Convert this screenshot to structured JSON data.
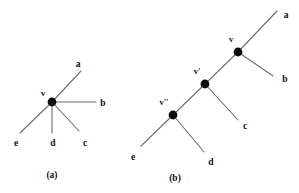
{
  "figure": {
    "background_color": "#ffffff",
    "edge_color": "#6e6e6e",
    "node_color": "#0b0b0b",
    "text_color": "#111111",
    "panels": [
      {
        "id": "panel-a",
        "caption": "(a)",
        "node_labels": [
          "v"
        ],
        "leaf_labels": [
          "a",
          "b",
          "c",
          "d",
          "e"
        ]
      },
      {
        "id": "panel-b",
        "caption": "(b)",
        "node_labels": [
          "v",
          "v'",
          "v''"
        ],
        "leaf_labels": [
          "a",
          "b",
          "c",
          "d",
          "e"
        ]
      }
    ]
  },
  "panel_a": {
    "caption": "(a)",
    "center_label": "v",
    "leaf_a": "a",
    "leaf_b": "b",
    "leaf_c": "c",
    "leaf_d": "d",
    "leaf_e": "e"
  },
  "panel_b": {
    "caption": "(b)",
    "node_v": "v",
    "node_v_prime": "v'",
    "node_v_double_prime": "v''",
    "leaf_a": "a",
    "leaf_b": "b",
    "leaf_c": "c",
    "leaf_d": "d",
    "leaf_e": "e"
  }
}
